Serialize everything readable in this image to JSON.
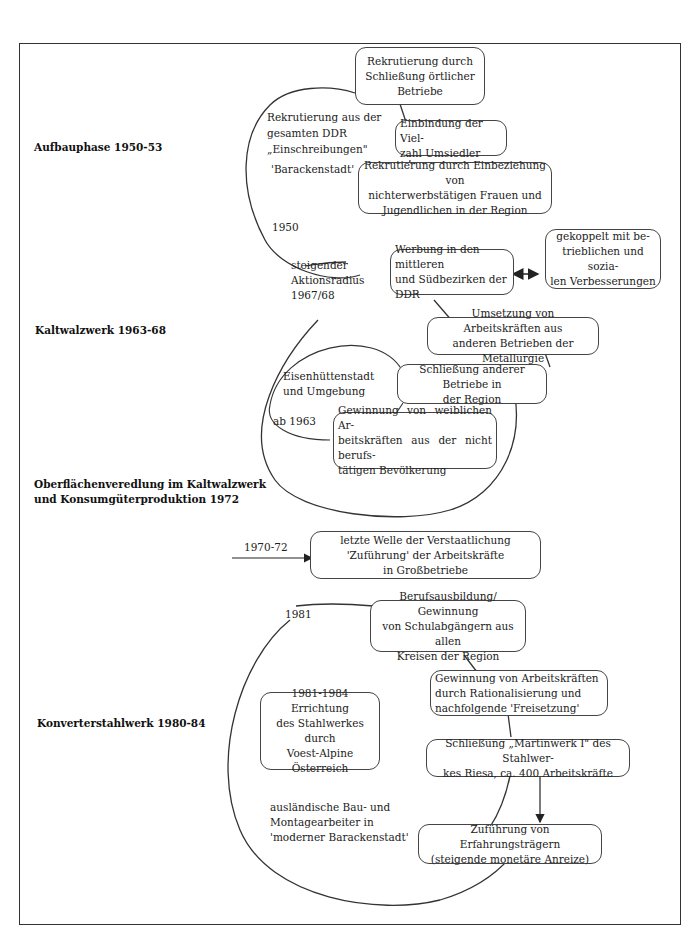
{
  "phases": {
    "aufbau": "Aufbauphase 1950-53",
    "kaltwalz": "Kaltwalzwerk 1963-68",
    "oberflaeche": "Oberflächenveredlung im Kaltwalzwerk\nund Konsumgüterproduktion 1972",
    "konverter": "Konverterstahlwerk 1980-84"
  },
  "section1": {
    "circle_text": "Rekrutierung aus der\ngesamten DDR\n„Einschreibungen\"",
    "circle_text2": "'Barackenstadt'",
    "year": "1950",
    "boxes": [
      "Rekrutierung durch\nSchließung örtlicher\nBetriebe",
      "Einbindung der Viel-\nzahl Umsiedler",
      "Rekrutierung durch Einbeziehung von\nnichterwerbstätigen Frauen und\nJugendlichen in der Region"
    ]
  },
  "section2": {
    "radius_label": "steigender\nAktionsradius\n1967/68",
    "inner_label": "Eisenhüttenstadt\nund Umgebung",
    "year": "ab 1963",
    "boxes": [
      "Werbung in den mittleren\nund Südbezirken der DDR",
      "gekoppelt mit be-\ntrieblichen und sozia-\nlen Verbesserungen",
      "Umsetzung von Arbeitskräften aus\nanderen Betrieben der Metallurgie",
      "Schließung anderer Betriebe in\nder Region",
      "Gewinnung von weiblichen Ar-\nbeitskräften aus der nicht berufs-\ntätigen Bevölkerung"
    ]
  },
  "section3": {
    "year": "1970-72",
    "box": "letzte Welle der Verstaatlichung\n'Zuführung' der Arbeitskräfte\nin Großbetriebe"
  },
  "section4": {
    "year": "1981",
    "circle_text": "ausländische Bau- und\nMontagearbeiter in\n'moderner Barackenstadt'",
    "boxes": [
      "Berufsausbildung/ Gewinnung\nvon Schulabgängern aus allen\nKreisen der Region",
      "Gewinnung von Arbeitskräften\ndurch Rationalisierung und\nnachfolgende 'Freisetzung'",
      "1981-1984 Errichtung\ndes Stahlwerkes durch\nVoest-Alpine\nÖsterreich",
      "Schließung „Martinwerk I\" des Stahlwer-\nkes Riesa, ca. 400 Arbeitskräfte",
      "Zuführung von Erfahrungsträgern\n(steigende monetäre Anreize)"
    ]
  },
  "colors": {
    "line": "#333333",
    "background": "#ffffff",
    "text": "#1a1a1a"
  }
}
